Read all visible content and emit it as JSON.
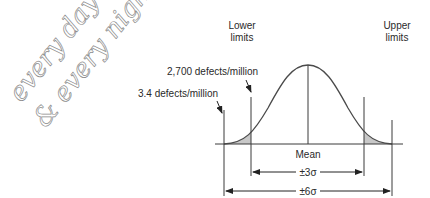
{
  "handwriting": {
    "line1": "every day",
    "line2": "& every night...~"
  },
  "labels": {
    "lower_limits_line1": "Lower",
    "lower_limits_line2": "limits",
    "upper_limits_line1": "Upper",
    "upper_limits_line2": "limits",
    "defects_3sigma": "2,700 defects/million",
    "defects_6sigma": "3.4 defects/million",
    "mean": "Mean",
    "range_3sigma": "±3σ",
    "range_6sigma": "±6σ"
  },
  "colors": {
    "line": "#3a3a3a",
    "shade": "#c8c8c8",
    "handwriting": "#9a9a9a"
  }
}
